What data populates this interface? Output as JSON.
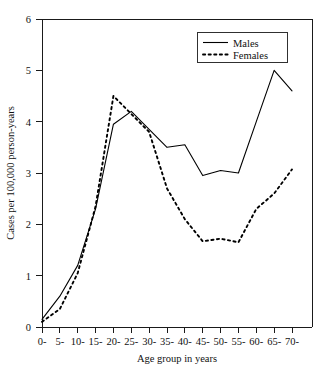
{
  "chart_data": {
    "type": "line",
    "title": "",
    "xlabel": "Age group in years",
    "ylabel": "Cases per 100,000 person-years",
    "categories": [
      "0-",
      "5-",
      "10-",
      "15-",
      "20-",
      "25-",
      "30-",
      "35-",
      "40-",
      "45-",
      "50-",
      "55-",
      "60-",
      "65-",
      "70-"
    ],
    "series": [
      {
        "name": "Males",
        "style": "solid",
        "color": "#000000",
        "values": [
          0.15,
          0.6,
          1.2,
          2.3,
          3.95,
          4.2,
          3.85,
          3.5,
          3.55,
          2.95,
          3.05,
          3.0,
          4.0,
          5.0,
          4.6
        ]
      },
      {
        "name": "Females",
        "style": "dashed",
        "color": "#000000",
        "values": [
          0.1,
          0.35,
          1.05,
          2.35,
          4.5,
          4.15,
          3.8,
          2.7,
          2.1,
          1.67,
          1.72,
          1.65,
          2.3,
          2.6,
          3.07
        ]
      }
    ],
    "ylim": [
      0,
      6
    ],
    "yticks": [
      0,
      1,
      2,
      3,
      4,
      5,
      6
    ],
    "ytick_labels": [
      "0",
      "1",
      "2",
      "3",
      "4",
      "5",
      "6"
    ],
    "grid": false,
    "legend_position": "top-right",
    "legend_entries": [
      "Males",
      "Females"
    ]
  },
  "axes": {
    "y_tick_0": "0",
    "y_tick_1": "1",
    "y_tick_2": "2",
    "y_tick_3": "3",
    "y_tick_4": "4",
    "y_tick_5": "5",
    "y_tick_6": "6",
    "x_tick_0": "0-",
    "x_tick_1": "5-",
    "x_tick_2": "10-",
    "x_tick_3": "15-",
    "x_tick_4": "20-",
    "x_tick_5": "25-",
    "x_tick_6": "30-",
    "x_tick_7": "35-",
    "x_tick_8": "40-",
    "x_tick_9": "45-",
    "x_tick_10": "50-",
    "x_tick_11": "55-",
    "x_tick_12": "60-",
    "x_tick_13": "65-",
    "x_tick_14": "70-"
  },
  "legend": {
    "males_label": "Males",
    "females_label": "Females"
  }
}
